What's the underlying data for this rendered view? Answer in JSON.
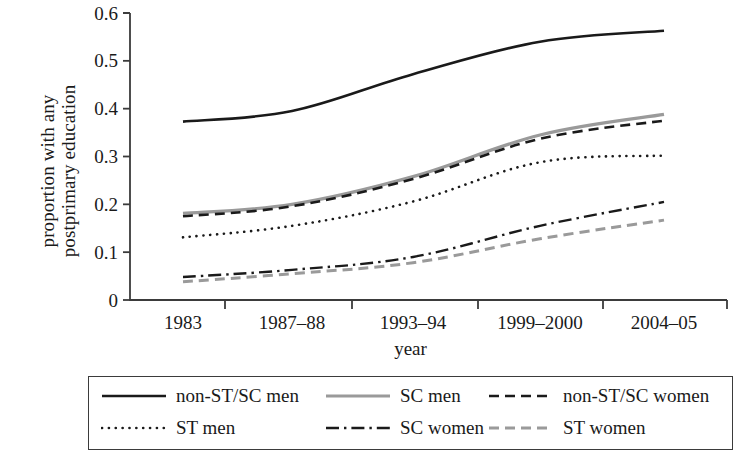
{
  "chart_data": {
    "type": "line",
    "title": "",
    "xlabel": "year",
    "ylabel_lines": [
      "proportion with any",
      "postprimary education"
    ],
    "ylabel": "proportion with any postprimary education",
    "categories": [
      "1983",
      "1987–88",
      "1993–94",
      "1999–2000",
      "2004–05"
    ],
    "x_tick_labels": [
      "1983",
      "1987–88",
      "1993–94",
      "1999–2000",
      "2004–05"
    ],
    "y_tick_labels": [
      "0.6",
      "0.5",
      "0.4",
      "0.3",
      "0.2",
      "0.1",
      "0"
    ],
    "y_tick_values": [
      0.6,
      0.5,
      0.4,
      0.3,
      0.2,
      0.1,
      0
    ],
    "ylim": [
      0,
      0.6
    ],
    "grid": false,
    "legend_position": "bottom",
    "series": [
      {
        "name": "non-ST/SC men",
        "values": [
          0.373,
          0.395,
          0.472,
          0.54,
          0.563
        ],
        "style": "solid",
        "color": "#1a1a1a",
        "width": 2.6
      },
      {
        "name": "SC men",
        "values": [
          0.181,
          0.2,
          0.258,
          0.345,
          0.388
        ],
        "style": "solid",
        "color": "#9a9a9a",
        "width": 3.2
      },
      {
        "name": "non-ST/SC women",
        "values": [
          0.175,
          0.196,
          0.253,
          0.337,
          0.375
        ],
        "style": "dashed",
        "color": "#1a1a1a",
        "width": 2.6
      },
      {
        "name": "ST men",
        "values": [
          0.131,
          0.155,
          0.206,
          0.288,
          0.302
        ],
        "style": "dotted",
        "color": "#1a1a1a",
        "width": 2.6
      },
      {
        "name": "SC women",
        "values": [
          0.048,
          0.063,
          0.09,
          0.155,
          0.205
        ],
        "style": "dashdot",
        "color": "#1a1a1a",
        "width": 2.4
      },
      {
        "name": "ST women",
        "values": [
          0.038,
          0.055,
          0.078,
          0.128,
          0.167
        ],
        "style": "dashed",
        "color": "#9a9a9a",
        "width": 3.0
      }
    ]
  },
  "legend": {
    "rows": [
      [
        {
          "label": "non-ST/SC men",
          "series_index": 0
        },
        {
          "label": "SC men",
          "series_index": 1
        },
        {
          "label": "non-ST/SC women",
          "series_index": 2
        }
      ],
      [
        {
          "label": "ST men",
          "series_index": 3
        },
        {
          "label": "SC women",
          "series_index": 4
        },
        {
          "label": "ST women",
          "series_index": 5
        }
      ]
    ]
  },
  "colors": {
    "axis": "#3b3b3b",
    "dark_series": "#1a1a1a",
    "gray_series": "#9a9a9a",
    "background": "#ffffff"
  }
}
